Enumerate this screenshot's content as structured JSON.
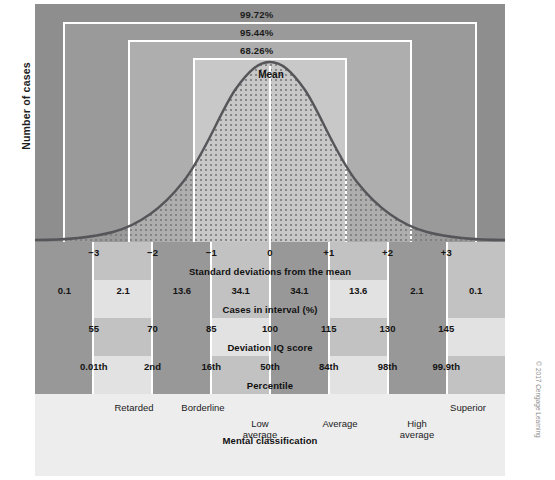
{
  "figure": {
    "y_axis_label": "Number of cases",
    "mean_label": "Mean",
    "copyright": "© 2017 Cengage Learning"
  },
  "bands": [
    {
      "name": "three-sigma",
      "label": "99.72%"
    },
    {
      "name": "two-sigma",
      "label": "95.44%"
    },
    {
      "name": "one-sigma",
      "label": "68.26%"
    }
  ],
  "rows": {
    "sd": {
      "caption": "Standard deviations from the mean",
      "ticks": [
        "−3",
        "−2",
        "−1",
        "0",
        "+1",
        "+2",
        "+3"
      ]
    },
    "ci": {
      "caption": "Cases in interval (%)",
      "cells": [
        "0.1",
        "2.1",
        "13.6",
        "34.1",
        "34.1",
        "13.6",
        "2.1",
        "0.1"
      ]
    },
    "iq": {
      "caption": "Deviation IQ score",
      "ticks": [
        "55",
        "70",
        "85",
        "100",
        "115",
        "130",
        "145"
      ]
    },
    "pc": {
      "caption": "Percentile",
      "ticks": [
        "0.01th",
        "2nd",
        "16th",
        "50th",
        "84th",
        "98th",
        "99.9th"
      ]
    },
    "mc": {
      "caption": "Mental classification",
      "items": [
        {
          "label": "Retarded",
          "x": 134,
          "y": 8
        },
        {
          "label": "Borderline",
          "x": 203,
          "y": 8
        },
        {
          "label": "Low\naverage",
          "x": 260,
          "y": 24
        },
        {
          "label": "Average",
          "x": 340,
          "y": 24
        },
        {
          "label": "High\naverage",
          "x": 417,
          "y": 24
        },
        {
          "label": "Superior",
          "x": 468,
          "y": 8
        },
        {
          "label": "Gifted",
          "x": 533,
          "y": 8
        }
      ]
    }
  },
  "chart_data": {
    "type": "line",
    "xlabel": "Standard deviations from the mean",
    "ylabel": "Number of cases",
    "xlim": [
      -4,
      4
    ],
    "ylim": [
      0,
      1
    ],
    "grid": false,
    "legend": "none",
    "distribution": "normal (Gaussian)",
    "mean": 0,
    "sd": 1,
    "x": [
      -4,
      -3,
      -2,
      -1,
      0,
      1,
      2,
      3,
      4
    ],
    "y": [
      0.0003,
      0.0111,
      0.1353,
      0.6065,
      1.0,
      0.6065,
      0.1353,
      0.0111,
      0.0003
    ],
    "annotations": [
      "99.72%",
      "95.44%",
      "68.26%",
      "Mean"
    ],
    "interval_percentages": [
      0.1,
      2.1,
      13.6,
      34.1,
      34.1,
      13.6,
      2.1,
      0.1
    ],
    "sd_ticks": [
      -3,
      -2,
      -1,
      0,
      1,
      2,
      3
    ],
    "iq_ticks": [
      55,
      70,
      85,
      100,
      115,
      130,
      145
    ],
    "percentile_ticks": [
      "0.01th",
      "2nd",
      "16th",
      "50th",
      "84th",
      "98th",
      "99.9th"
    ],
    "classification_labels": [
      "Retarded",
      "Borderline",
      "Low average",
      "Average",
      "High average",
      "Superior",
      "Gifted"
    ],
    "cumulative_band_coverage": {
      "1sd": 68.26,
      "2sd": 95.44,
      "3sd": 99.72
    }
  }
}
